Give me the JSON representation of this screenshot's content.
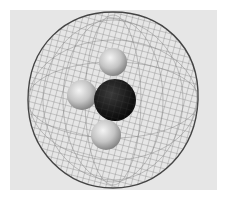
{
  "figure": {
    "background_color": "#e6e6e6",
    "page_color": "#ffffff",
    "mesh_color": "#555555",
    "atoms": [
      {
        "element": "C",
        "label": "carbon",
        "cx": 115,
        "cy": 100,
        "r": 21,
        "color": "#111111"
      },
      {
        "element": "H",
        "label": "hydrogen-top",
        "cx": 113,
        "cy": 62,
        "r": 14,
        "color": "#c8c8c8"
      },
      {
        "element": "H",
        "label": "hydrogen-left",
        "cx": 82,
        "cy": 95,
        "r": 15,
        "color": "#c8c8c8"
      },
      {
        "element": "H",
        "label": "hydrogen-bottom",
        "cx": 106,
        "cy": 135,
        "r": 15,
        "color": "#c0c0c0"
      }
    ],
    "surface_bounds": {
      "left": 28,
      "top": 12,
      "right": 198,
      "bottom": 188
    }
  }
}
